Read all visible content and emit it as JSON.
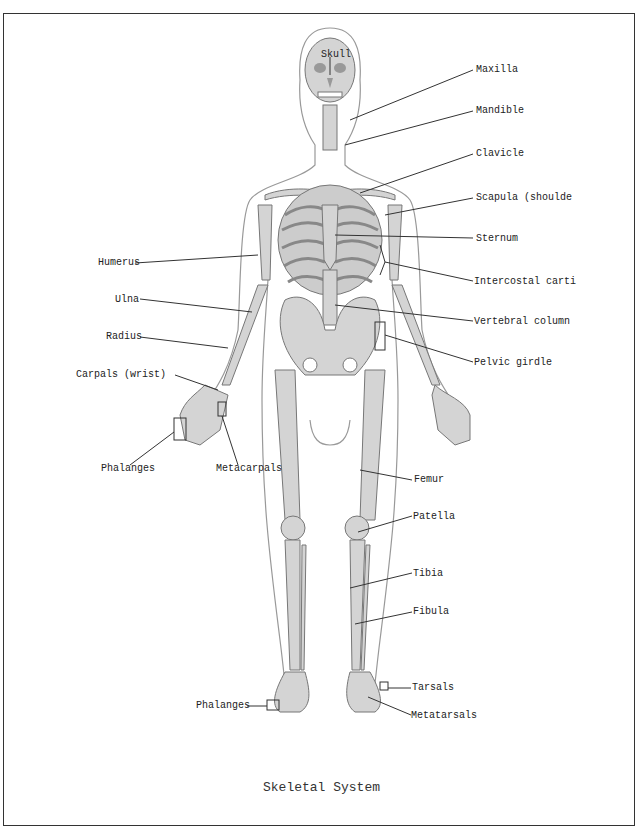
{
  "figure": {
    "title": "Skeletal System",
    "labels": {
      "skull": "Skull",
      "maxilla": "Maxilla",
      "mandible": "Mandible",
      "clavicle": "Clavicle",
      "scapula": "Scapula (shoulde",
      "sternum": "Sternum",
      "intercostal": "Intercostal carti",
      "vertebral": "Vertebral column",
      "pelvic": "Pelvic girdle",
      "humerus": "Humerus",
      "ulna": "Ulna",
      "radius": "Radius",
      "carpals": "Carpals (wrist)",
      "phalanges_hand": "Phalanges",
      "metacarpals": "Metacarpals",
      "femur": "Femur",
      "patella": "Patella",
      "tibia": "Tibia",
      "fibula": "Fibula",
      "tarsals": "Tarsals",
      "phalanges_foot": "Phalanges",
      "metatarsals": "Metatarsals"
    }
  }
}
